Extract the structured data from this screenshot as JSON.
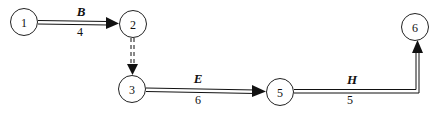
{
  "diagram": {
    "type": "activity-network",
    "nodes": [
      {
        "id": "1",
        "label": "1",
        "x": 24,
        "y": 22
      },
      {
        "id": "2",
        "label": "2",
        "x": 133,
        "y": 24
      },
      {
        "id": "3",
        "label": "3",
        "x": 132,
        "y": 89
      },
      {
        "id": "5",
        "label": "5",
        "x": 280,
        "y": 92
      },
      {
        "id": "6",
        "label": "6",
        "x": 415,
        "y": 27
      }
    ],
    "edges": [
      {
        "from": "1",
        "to": "2",
        "activity": "B",
        "duration": "4",
        "style": "double"
      },
      {
        "from": "2",
        "to": "3",
        "activity": "",
        "duration": "",
        "style": "dashed-double"
      },
      {
        "from": "3",
        "to": "5",
        "activity": "E",
        "duration": "6",
        "style": "double"
      },
      {
        "from": "5",
        "to": "6",
        "activity": "H",
        "duration": "5",
        "style": "double"
      }
    ]
  }
}
